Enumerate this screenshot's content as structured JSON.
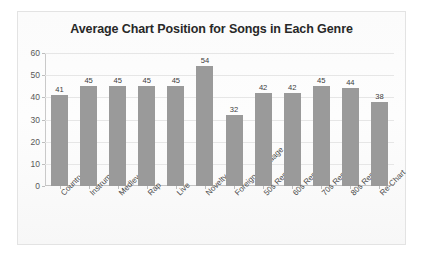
{
  "chart_data": {
    "type": "bar",
    "title": "Average Chart Position for Songs in Each Genre",
    "xlabel": "",
    "ylabel": "",
    "ylim": [
      0,
      60
    ],
    "yticks": [
      0,
      10,
      20,
      30,
      40,
      50,
      60
    ],
    "grid": true,
    "legend": "none",
    "bar_color": "#9a9a9a",
    "categories": [
      "Country",
      "Instrumental",
      "Medley",
      "Rap",
      "Live",
      "Novelty",
      "Foreign Language",
      "50s Remake",
      "60s Remake",
      "70s Remake",
      "80s Remake",
      "Re-Chart"
    ],
    "values": [
      41,
      45,
      45,
      45,
      45,
      54,
      32,
      42,
      42,
      45,
      44,
      38
    ],
    "data_labels": [
      "41",
      "45",
      "45",
      "45",
      "45",
      "54",
      "32",
      "42",
      "42",
      "45",
      "44",
      "38"
    ],
    "ytick_labels": [
      "0",
      "10",
      "20",
      "30",
      "40",
      "50",
      "60"
    ]
  }
}
